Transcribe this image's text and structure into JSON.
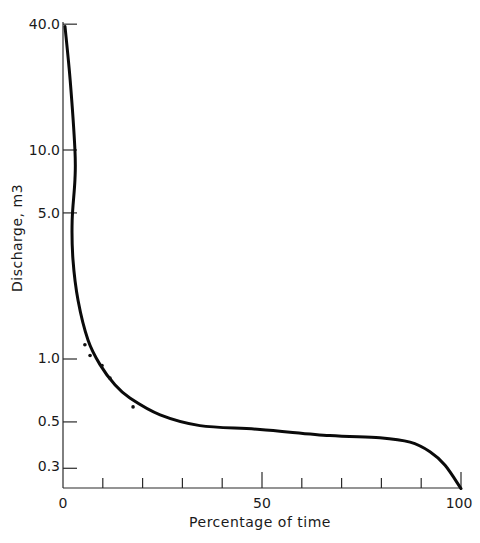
{
  "chart_data": {
    "type": "line",
    "title": "",
    "xlabel": "Percentage of time",
    "ylabel": "Discharge, m3",
    "xlim": [
      0,
      100
    ],
    "ylim": [
      0.235,
      40.0
    ],
    "yscale": "log",
    "grid": false,
    "legend": null,
    "x_ticks": [
      0,
      10,
      20,
      30,
      40,
      50,
      60,
      70,
      80,
      90,
      100
    ],
    "x_tick_labels": [
      "0",
      "50",
      "100"
    ],
    "y_ticks": [
      40.0,
      10.0,
      5.0,
      1.0,
      0.5,
      0.3
    ],
    "y_tick_labels": [
      "40.0",
      "10.0",
      "5.0",
      "1.0",
      "0.5",
      "0.3"
    ],
    "series": [
      {
        "name": "Flow duration curve",
        "kind": "line",
        "x": [
          0.5,
          1.8,
          3.0,
          3.0,
          2.3,
          2.5,
          3.8,
          6.3,
          9.3,
          13.1,
          16.8,
          24.4,
          34.4,
          49.5,
          67.0,
          79.6,
          87.2,
          92.2,
          96.0,
          100.0
        ],
        "y": [
          39.0,
          21.6,
          10.0,
          7.2,
          4.6,
          3.0,
          1.9,
          1.23,
          0.94,
          0.75,
          0.65,
          0.54,
          0.48,
          0.46,
          0.43,
          0.42,
          0.4,
          0.36,
          0.31,
          0.24
        ]
      },
      {
        "name": "Observed points",
        "kind": "scatter",
        "x": [
          5.5,
          6.8,
          9.8,
          11.8,
          17.6
        ],
        "y": [
          1.17,
          1.04,
          0.93,
          0.81,
          0.59
        ]
      }
    ]
  },
  "labels": {
    "y_ticks": [
      "40.0",
      "10.0",
      "5.0",
      "1.0",
      "0.5",
      "0.3"
    ],
    "x_ticks": [
      "0",
      "50",
      "100"
    ],
    "xlabel": "Percentage of time",
    "ylabel": "Discharge, m3"
  }
}
